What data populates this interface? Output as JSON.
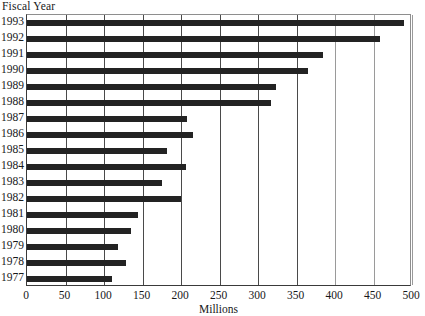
{
  "chart_data": {
    "type": "bar",
    "orientation": "horizontal",
    "title": "",
    "xlabel": "Millions",
    "ylabel": "Fiscal Year",
    "xlim": [
      0,
      500
    ],
    "ylim": null,
    "grid": true,
    "legend": null,
    "xticks": [
      0,
      50,
      100,
      150,
      200,
      250,
      300,
      350,
      400,
      450,
      500
    ],
    "xtick_labels": [
      "0",
      "50",
      "100",
      "150",
      "200",
      "250",
      "300",
      "350",
      "400",
      "450",
      "500"
    ],
    "categories": [
      "1993",
      "1992",
      "1991",
      "1990",
      "1989",
      "1988",
      "1987",
      "1986",
      "1985",
      "1984",
      "1983",
      "1982",
      "1981",
      "1980",
      "1979",
      "1978",
      "1977"
    ],
    "values": [
      490,
      458,
      385,
      365,
      323,
      317,
      208,
      215,
      182,
      207,
      175,
      200,
      144,
      135,
      118,
      128,
      110
    ],
    "bar_color": "#232323"
  },
  "axes": {
    "y_title": "Fiscal Year",
    "x_title": "Millions"
  },
  "colors": {
    "bar": "#232323",
    "grid": "#4a4a4a",
    "frame": "#8e8e8e",
    "text": "#17181a",
    "background": "#ffffff"
  }
}
